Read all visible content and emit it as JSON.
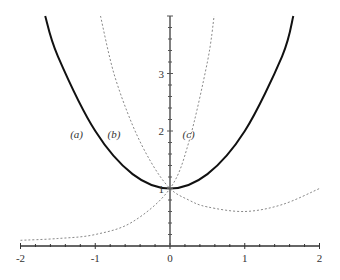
{
  "chart_data": {
    "type": "line",
    "title": "",
    "xlabel": "",
    "ylabel": "",
    "xlim": [
      -2,
      2
    ],
    "ylim": [
      0,
      4
    ],
    "grid": false,
    "legend": "none (inline curve labels)",
    "x_ticks": [
      -2,
      -1,
      0,
      1,
      2
    ],
    "x_tick_labels": [
      "-2",
      "-1",
      "0",
      "1",
      "2"
    ],
    "y_ticks": [
      1,
      2,
      3
    ],
    "y_tick_labels": [
      "1",
      "2",
      "3"
    ],
    "series": [
      {
        "name": "(a)",
        "style": "solid",
        "color": "#111111",
        "points": [
          [
            -1.67,
            4.0
          ],
          [
            -1.5,
            3.3
          ],
          [
            -1.0,
            2.0
          ],
          [
            -0.5,
            1.25
          ],
          [
            0,
            1.0
          ],
          [
            0.5,
            1.25
          ],
          [
            1.0,
            2.0
          ],
          [
            1.5,
            3.3
          ],
          [
            1.65,
            4.0
          ]
        ]
      },
      {
        "name": "(b)",
        "style": "dashed",
        "color": "#888888",
        "points": [
          [
            -0.93,
            4.0
          ],
          [
            -0.75,
            3.0
          ],
          [
            -0.5,
            2.1
          ],
          [
            -0.25,
            1.45
          ],
          [
            0,
            1.0
          ],
          [
            0.25,
            0.8
          ],
          [
            0.5,
            0.68
          ],
          [
            1.0,
            0.6
          ],
          [
            1.5,
            0.72
          ],
          [
            2.0,
            1.0
          ]
        ]
      },
      {
        "name": "(c)",
        "style": "dashed",
        "color": "#888888",
        "points": [
          [
            -2.0,
            0.1
          ],
          [
            -1.5,
            0.13
          ],
          [
            -1.0,
            0.2
          ],
          [
            -0.5,
            0.42
          ],
          [
            0,
            1.0
          ],
          [
            0.25,
            1.8
          ],
          [
            0.5,
            3.2
          ],
          [
            0.59,
            4.0
          ]
        ]
      }
    ],
    "annotations": [
      {
        "text": "(a)",
        "x": -1.25,
        "y": 1.95
      },
      {
        "text": "(b)",
        "x": -0.75,
        "y": 1.95
      },
      {
        "text": "(c)",
        "x": 0.25,
        "y": 1.95
      }
    ]
  }
}
